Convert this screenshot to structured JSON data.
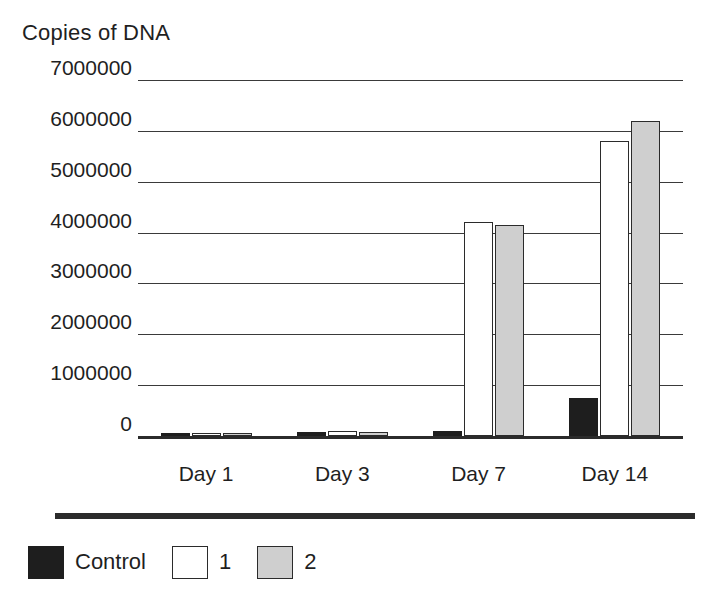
{
  "chart_data": {
    "type": "bar",
    "title": "Copies of DNA",
    "xlabel": "",
    "ylabel": "Copies of DNA",
    "categories": [
      "Day 1",
      "Day 3",
      "Day 7",
      "Day 14"
    ],
    "series": [
      {
        "name": "Control",
        "color": "#1e1e1e",
        "values": [
          60000,
          80000,
          100000,
          750000
        ]
      },
      {
        "name": "1",
        "color": "#ffffff",
        "values": [
          50000,
          100000,
          4200000,
          5800000
        ]
      },
      {
        "name": "2",
        "color": "#cfcfcf",
        "values": [
          50000,
          70000,
          4150000,
          6200000
        ]
      }
    ],
    "ylim": [
      0,
      7000000
    ],
    "y_ticks": [
      0,
      1000000,
      2000000,
      3000000,
      4000000,
      5000000,
      6000000,
      7000000
    ],
    "y_tick_labels": [
      "0",
      "1000000",
      "2000000",
      "3000000",
      "4000000",
      "5000000",
      "6000000",
      "7000000"
    ],
    "grid": true,
    "legend_position": "bottom-left",
    "legend_entries": [
      "Control",
      "1",
      "2"
    ],
    "colors": {
      "control": "#1e1e1e",
      "series_1": "#ffffff",
      "series_2": "#cfcfcf",
      "axis": "#2b2b2b",
      "grid": "#3a3a3a",
      "text": "#1f1f1f",
      "background": "#ffffff"
    }
  }
}
